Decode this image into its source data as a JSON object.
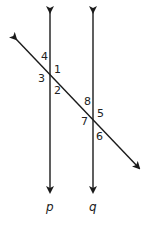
{
  "diagram": {
    "type": "parallel lines cut by a transversal",
    "lines": [
      {
        "name": "p",
        "label": "p",
        "x": 50,
        "y1": 12,
        "y2": 192
      },
      {
        "name": "q",
        "label": "q",
        "x": 93,
        "y1": 12,
        "y2": 192
      }
    ],
    "transversal": {
      "x1": 16,
      "y1": 39,
      "x2": 139,
      "y2": 168
    },
    "angles": [
      {
        "label": "4",
        "x": 41,
        "y": 60
      },
      {
        "label": "1",
        "x": 54,
        "y": 73
      },
      {
        "label": "3",
        "x": 38,
        "y": 82
      },
      {
        "label": "2",
        "x": 54,
        "y": 94
      },
      {
        "label": "8",
        "x": 84,
        "y": 105
      },
      {
        "label": "5",
        "x": 97,
        "y": 117
      },
      {
        "label": "7",
        "x": 81,
        "y": 125
      },
      {
        "label": "6",
        "x": 96,
        "y": 140
      }
    ],
    "line_labels": [
      {
        "label": "p",
        "x": 46,
        "y": 211
      },
      {
        "label": "q",
        "x": 89,
        "y": 211
      }
    ],
    "stroke_color": "#1a1a1a"
  }
}
